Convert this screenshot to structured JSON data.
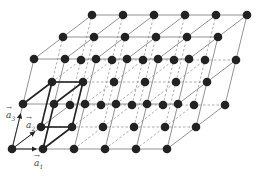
{
  "diagram": {
    "type": "crystal-lattice",
    "grid": {
      "nx": 6,
      "ny": 3,
      "nz": 3
    },
    "origin": [
      12,
      149
    ],
    "basis_px": {
      "a1": [
        31,
        0
      ],
      "a2": [
        29,
        -22
      ],
      "a3": [
        11,
        -45
      ]
    },
    "atom_color": "#222222",
    "line_color": "#777777",
    "bold_color": "#222222",
    "labels": [
      {
        "id": "a1",
        "text": "a",
        "sub": "1",
        "x": 34,
        "y": 159
      },
      {
        "id": "a2",
        "text": "a",
        "sub": "2",
        "x": 26,
        "y": 121
      },
      {
        "id": "a3",
        "text": "a",
        "sub": "3",
        "x": 6,
        "y": 111
      }
    ]
  }
}
